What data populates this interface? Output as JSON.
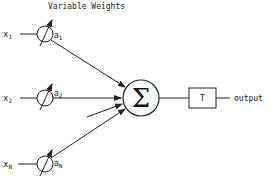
{
  "diagram": {
    "title": "Variable Weights",
    "inputs": [
      {
        "label": "x",
        "sub": "1",
        "weight": "a",
        "weight_sub": "1"
      },
      {
        "label": "x",
        "sub": "2",
        "weight": "a",
        "weight_sub": "2"
      },
      {
        "label": "x",
        "sub": "N",
        "weight": "a",
        "weight_sub": "N"
      }
    ],
    "summation_symbol": "Σ",
    "threshold_label": "T",
    "output_label": "output"
  }
}
